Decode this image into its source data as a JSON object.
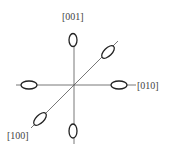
{
  "diagram": {
    "type": "crystal-axes-orientation",
    "labels": {
      "top": "[001]",
      "right": "[010]",
      "bottom_left": "[100]"
    },
    "colors": {
      "axis": "#555555",
      "ellipse": "#222222",
      "label": "#444444",
      "background": "#ffffff"
    }
  }
}
